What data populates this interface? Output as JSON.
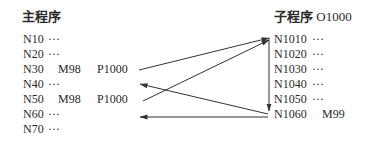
{
  "main_program": {
    "title": "主程序",
    "lines": [
      {
        "n": "N10",
        "rest": "···"
      },
      {
        "n": "N20",
        "rest": "···"
      },
      {
        "n": "N30",
        "cmd": "M98",
        "arg": "P1000"
      },
      {
        "n": "N40",
        "rest": "···"
      },
      {
        "n": "N50",
        "cmd": "M98",
        "arg": "P1000"
      },
      {
        "n": "N60",
        "rest": "···"
      },
      {
        "n": "N70",
        "rest": "···"
      }
    ]
  },
  "sub_program": {
    "title": "子程序",
    "program_number": "O1000",
    "lines": [
      {
        "n": "N1010",
        "rest": "···"
      },
      {
        "n": "N1020",
        "rest": "···"
      },
      {
        "n": "N1030",
        "rest": "···"
      },
      {
        "n": "N1040",
        "rest": "···"
      },
      {
        "n": "N1050",
        "rest": "···"
      },
      {
        "n": "N1060",
        "cmd": "M99"
      }
    ]
  },
  "arrows": [
    {
      "from": "N30 M98 P1000",
      "to": "N1010"
    },
    {
      "from": "N50 M98 P1000",
      "to": "N1010"
    },
    {
      "from": "N1010",
      "to": "N1060"
    },
    {
      "from": "N1060 M99",
      "to": "N40"
    },
    {
      "from": "N1060 M99",
      "to": "N60"
    }
  ],
  "colors": {
    "text": "#2a2a2a",
    "arrow": "#333333",
    "background": "#ffffff"
  }
}
